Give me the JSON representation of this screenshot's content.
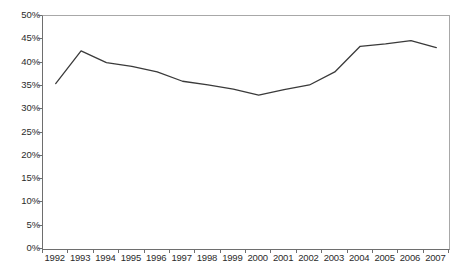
{
  "chart_data": {
    "type": "line",
    "title": "",
    "subtitle": "",
    "xlabel": "",
    "ylabel": "",
    "categories": [
      "1992",
      "1993",
      "1994",
      "1995",
      "1996",
      "1997",
      "1998",
      "1999",
      "2000",
      "2001",
      "2002",
      "2003",
      "2004",
      "2005",
      "2006",
      "2007"
    ],
    "series": [
      {
        "name": "",
        "values": [
          35.5,
          42.5,
          40.0,
          39.2,
          38.0,
          36.0,
          35.2,
          34.3,
          33.0,
          34.2,
          35.2,
          38.0,
          43.5,
          44.0,
          44.7,
          43.2
        ]
      }
    ],
    "ylim": [
      0,
      50
    ],
    "ytick_values": [
      0,
      5,
      10,
      15,
      20,
      25,
      30,
      35,
      40,
      45,
      50
    ],
    "ytick_labels": [
      "0%",
      "5%",
      "10%",
      "15%",
      "20%",
      "25%",
      "30%",
      "35%",
      "40%",
      "45%",
      "50%"
    ],
    "grid": false,
    "legend": "none",
    "line_color": "#3a3a3a",
    "axis_color": "#6e6e6e",
    "frame_color": "#a8a8a8",
    "background_color": "#ffffff",
    "text_color": "#2b2b2b"
  }
}
